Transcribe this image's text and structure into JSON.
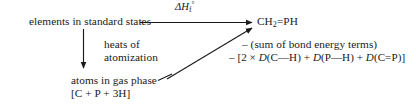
{
  "diagram": {
    "kind": "thermochemical-cycle",
    "background_color": "#ffffff",
    "ink_color": "#1a1a1a",
    "nodes": {
      "reactants": "elements in standard states",
      "product_formula": "CH₂=PH",
      "atoms": "atoms in gas phase",
      "atoms_formula": "[C + P + 3H]"
    },
    "paths": {
      "formation_label": "ΔH",
      "formation_sub": "f",
      "formation_sup": "°",
      "atomization_line1": "heats of",
      "atomization_line2": "atomization"
    },
    "annotations": {
      "line1": "– (sum of bond energy terms)",
      "line2_prefix": "– [2 × ",
      "term1_fn": "D",
      "term1_arg": "(C—H)",
      "plus1": " + ",
      "term2_fn": "D",
      "term2_arg": "(P—H)",
      "plus2": " + ",
      "term3_fn": "D",
      "term3_arg": "(C=P)",
      "line2_suffix": "]"
    },
    "arrows": [
      {
        "name": "formation-arrow",
        "from": [
          150,
          22
        ],
        "to": [
          256,
          22
        ],
        "style": "solid-arrowhead"
      },
      {
        "name": "atomization-arrow",
        "from": [
          83,
          28
        ],
        "to": [
          83,
          71
        ],
        "style": "solid-arrowhead"
      },
      {
        "name": "bond-energy-arrow",
        "from": [
          166,
          79
        ],
        "to": [
          256,
          26
        ],
        "style": "solid-arrowhead"
      }
    ],
    "connectors": [
      {
        "name": "reactants-connector",
        "from": [
          139,
          22
        ],
        "to": [
          152,
          22
        ]
      },
      {
        "name": "atoms-connector",
        "from": [
          158,
          80
        ],
        "to": [
          170,
          74
        ]
      }
    ]
  }
}
